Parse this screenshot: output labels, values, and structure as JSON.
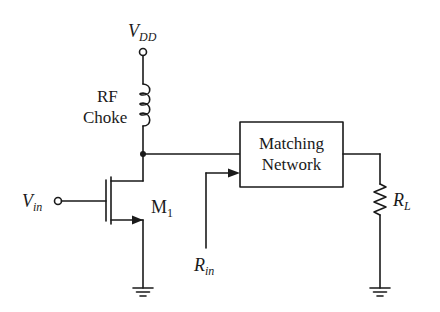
{
  "diagram": {
    "type": "circuit-schematic",
    "title": "",
    "labels": {
      "vdd": {
        "main": "V",
        "sub": "DD"
      },
      "rf_choke_line1": "RF",
      "rf_choke_line2": "Choke",
      "vin": {
        "main": "V",
        "sub": "in"
      },
      "m1": {
        "main": "M",
        "sub": "1"
      },
      "rin": {
        "main": "R",
        "sub": "in"
      },
      "rl": {
        "main": "R",
        "sub": "L"
      },
      "matching_network_line1": "Matching",
      "matching_network_line2": "Network"
    },
    "components": [
      {
        "id": "vdd_terminal",
        "kind": "terminal",
        "label": "VDD"
      },
      {
        "id": "rf_choke",
        "kind": "inductor",
        "label": "RF Choke"
      },
      {
        "id": "m1",
        "kind": "nmos_transistor",
        "label": "M1"
      },
      {
        "id": "vin_terminal",
        "kind": "terminal",
        "label": "Vin"
      },
      {
        "id": "matching_network",
        "kind": "block",
        "label": "Matching Network"
      },
      {
        "id": "rl",
        "kind": "resistor",
        "label": "RL"
      },
      {
        "id": "gnd_m1",
        "kind": "ground"
      },
      {
        "id": "gnd_rl",
        "kind": "ground"
      },
      {
        "id": "rin_arrow",
        "kind": "arrow",
        "label": "Rin"
      }
    ],
    "connections": [
      [
        "vdd_terminal",
        "rf_choke"
      ],
      [
        "rf_choke",
        "m1.drain"
      ],
      [
        "m1.drain",
        "matching_network.input"
      ],
      [
        "vin_terminal",
        "m1.gate"
      ],
      [
        "m1.source",
        "gnd_m1"
      ],
      [
        "matching_network.output",
        "rl"
      ],
      [
        "rl",
        "gnd_rl"
      ]
    ],
    "colors": {
      "stroke": "#1a1a1a",
      "background": "#ffffff"
    }
  }
}
